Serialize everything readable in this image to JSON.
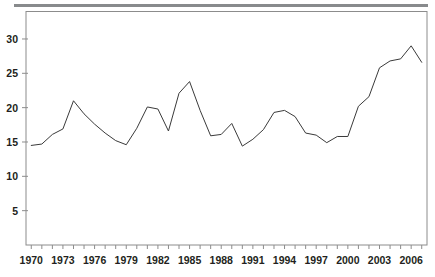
{
  "figure": {
    "top_rule_color": "#888a8c",
    "frame_color": "#8c8c8c",
    "line_color": "#3a3a3a",
    "text_color": "#231f20",
    "background": "#ffffff"
  },
  "chart_data": {
    "type": "line",
    "title": "",
    "subtitle": "",
    "xlabel": "",
    "ylabel": "",
    "xlim": [
      1969.5,
      2007.5
    ],
    "ylim": [
      0,
      34
    ],
    "grid": false,
    "legend": null,
    "x_tick_labels": [
      "1970",
      "1973",
      "1976",
      "1979",
      "1982",
      "1985",
      "1988",
      "1991",
      "1994",
      "1997",
      "2000",
      "2003",
      "2006"
    ],
    "x_tick_values": [
      1970,
      1973,
      1976,
      1979,
      1982,
      1985,
      1988,
      1991,
      1994,
      1997,
      2000,
      2003,
      2006
    ],
    "x_minor_ticks": [
      1970,
      1971,
      1972,
      1973,
      1974,
      1975,
      1976,
      1977,
      1978,
      1979,
      1980,
      1981,
      1982,
      1983,
      1984,
      1985,
      1986,
      1987,
      1988,
      1989,
      1990,
      1991,
      1992,
      1993,
      1994,
      1995,
      1996,
      1997,
      1998,
      1999,
      2000,
      2001,
      2002,
      2003,
      2004,
      2005,
      2006,
      2007
    ],
    "y_tick_labels": [
      "5",
      "10",
      "15",
      "20",
      "25",
      "30"
    ],
    "y_tick_values": [
      5,
      10,
      15,
      20,
      25,
      30
    ],
    "series": [
      {
        "name": "series-1",
        "color": "#3a3a3a",
        "x": [
          1970,
          1971,
          1972,
          1973,
          1974,
          1975,
          1976,
          1977,
          1978,
          1979,
          1980,
          1981,
          1982,
          1983,
          1984,
          1985,
          1986,
          1987,
          1988,
          1989,
          1990,
          1991,
          1992,
          1993,
          1994,
          1995,
          1996,
          1997,
          1998,
          1999,
          2000,
          2001,
          2002,
          2003,
          2004,
          2005,
          2006,
          2007
        ],
        "values": [
          14.5,
          14.7,
          16.1,
          16.9,
          21.0,
          19.1,
          17.6,
          16.3,
          15.2,
          14.6,
          17.0,
          20.1,
          19.8,
          16.6,
          22.1,
          23.8,
          19.6,
          15.9,
          16.1,
          17.7,
          14.4,
          15.4,
          16.8,
          19.3,
          19.6,
          18.7,
          16.3,
          16.0,
          14.9,
          15.8,
          15.8,
          20.2,
          21.6,
          25.8,
          26.8,
          27.1,
          29.0,
          26.6
        ],
        "marker": "none",
        "linewidth": 1
      }
    ]
  }
}
